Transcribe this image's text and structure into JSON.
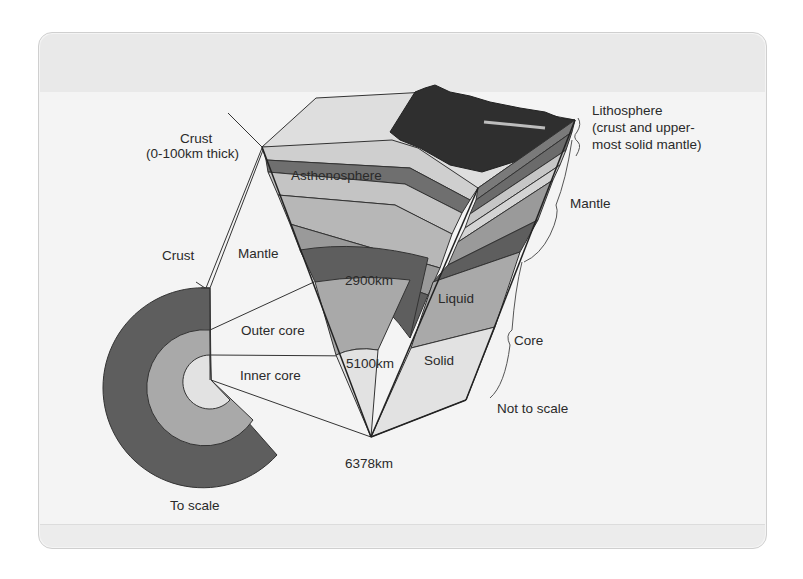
{
  "diagram": {
    "colors": {
      "card_bg": "#f4f4f4",
      "crust_light": "#d2d2d2",
      "lithosphere_dark": "#6b6b6b",
      "asthenosphere": "#bdbdbd",
      "upper_mantle": "#9a9a9a",
      "lower_mantle": "#5e5e5e",
      "outer_core": "#a9a9a9",
      "inner_core": "#e2e2e2",
      "mountains": "#2f2f2f",
      "outline": "#333333"
    },
    "labels": {
      "crust_top": "Crust",
      "crust_thickness": "(0-100km thick)",
      "lithosphere_line1": "Lithosphere",
      "lithosphere_line2": "(crust and upper-",
      "lithosphere_line3": "most solid mantle)",
      "asthenosphere": "Asthenosphere",
      "mantle_right": "Mantle",
      "crust_left": "Crust",
      "mantle_left": "Mantle",
      "depth_2900": "2900km",
      "liquid": "Liquid",
      "outer_core": "Outer core",
      "depth_5100": "5100km",
      "solid": "Solid",
      "core_right": "Core",
      "inner_core": "Inner core",
      "not_to_scale": "Not to scale",
      "depth_6378": "6378km",
      "to_scale": "To scale"
    }
  }
}
